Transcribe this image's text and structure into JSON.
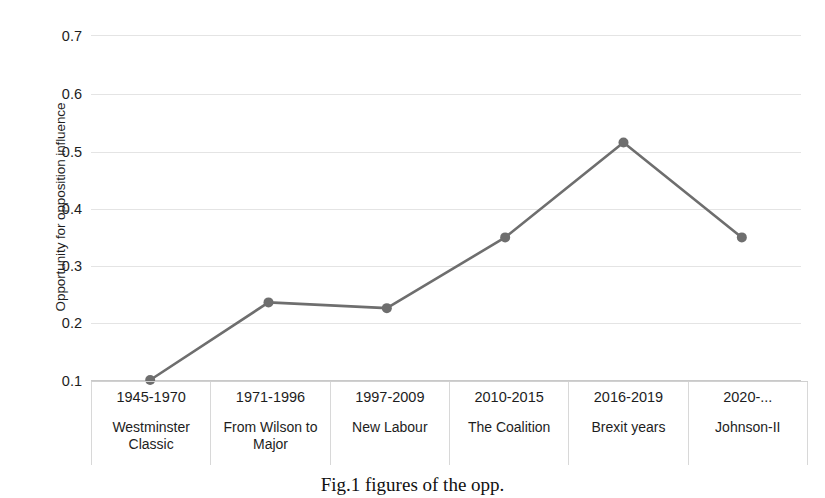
{
  "chart_data": {
    "type": "line",
    "title": "",
    "xlabel": "",
    "ylabel": "Opportunity for opposition influence",
    "ylim": [
      0.1,
      0.7
    ],
    "yticks": [
      0.7,
      0.6,
      0.5,
      0.4,
      0.3,
      0.2,
      0.1
    ],
    "ytick_labels": [
      "0.7",
      "0.6",
      "0.5",
      "0.4",
      "0.3",
      "0.2",
      "0.1"
    ],
    "grid": true,
    "legend": "none",
    "categories": [
      "1945-1970",
      "1971-1996",
      "1997-2009",
      "2010-2015",
      "2016-2019",
      "2020-..."
    ],
    "category_names": [
      "Westminster Classic",
      "From Wilson to Major",
      "New Labour",
      "The Coalition",
      "Brexit years",
      "Johnson-II"
    ],
    "values": [
      0.1,
      0.235,
      0.225,
      0.348,
      0.513,
      0.348
    ],
    "series": [
      {
        "name": "Opportunity for opposition influence",
        "values": [
          0.1,
          0.235,
          0.225,
          0.348,
          0.513,
          0.348
        ]
      }
    ],
    "line_color": "#6e6e6e",
    "marker_color": "#6e6e6e",
    "gridline_color": "#e4e4e4"
  },
  "caption": {
    "text": "Fig.1 figures of the opp."
  }
}
